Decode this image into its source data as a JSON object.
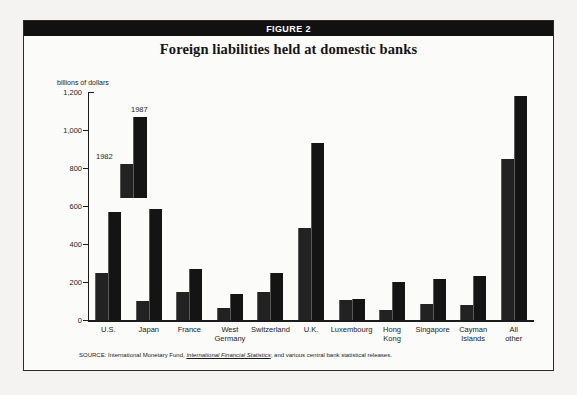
{
  "figure": {
    "header_label": "FIGURE 2",
    "title": "Foreign liabilities held at domestic banks",
    "source_prefix": "SOURCE: International Monetary Fund, ",
    "source_italic": "International Financial Statistics",
    "source_suffix": "; and various central bank statistical releases."
  },
  "legend": {
    "series_1982": "1982",
    "series_1987": "1987"
  },
  "colors": {
    "bar_1982": "#222222",
    "bar_1987": "#141414",
    "header_bg": "#111111",
    "header_text": "#ffffff",
    "axis": "#1b1b1b",
    "panel_bg": "#fbfbfa",
    "page_bg": "#f4f3f1"
  },
  "chart_data": {
    "type": "bar",
    "title": "Foreign liabilities held at domestic banks",
    "xlabel": "",
    "ylabel": "billions of dollars",
    "ylim": [
      0,
      1200
    ],
    "yticks": [
      0,
      200,
      400,
      600,
      800,
      1000,
      1200
    ],
    "ytick_labels": [
      "0",
      "200",
      "400",
      "600",
      "800",
      "1,000",
      "1,200"
    ],
    "grid": false,
    "legend_position": "inside-upper-left",
    "categories": [
      "U.S.",
      "Japan",
      "France",
      "West Germany",
      "Switzerland",
      "U.K.",
      "Luxembourg",
      "Hong Kong",
      "Singapore",
      "Cayman Islands",
      "All other"
    ],
    "category_lines": [
      [
        "U.S."
      ],
      [
        "Japan"
      ],
      [
        "France"
      ],
      [
        "West",
        "Germany"
      ],
      [
        "Switzerland"
      ],
      [
        "U.K."
      ],
      [
        "Luxembourg"
      ],
      [
        "Hong",
        "Kong"
      ],
      [
        "Singapore"
      ],
      [
        "Cayman",
        "Islands"
      ],
      [
        "All",
        "other"
      ]
    ],
    "series": [
      {
        "name": "1982",
        "values": [
          250,
          100,
          150,
          65,
          145,
          485,
          105,
          55,
          85,
          80,
          850
        ]
      },
      {
        "name": "1987",
        "values": [
          570,
          585,
          270,
          135,
          245,
          930,
          110,
          200,
          215,
          230,
          1180
        ]
      }
    ]
  }
}
